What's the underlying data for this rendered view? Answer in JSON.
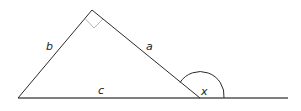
{
  "diagram": {
    "type": "right-triangle-exterior-angle",
    "labels": {
      "side_a": "a",
      "side_b": "b",
      "side_c": "c",
      "exterior_angle": "x"
    },
    "colors": {
      "line": "#2b2b2b",
      "right_angle_marker": "#b5b5b5",
      "baseline": "#555555"
    }
  }
}
